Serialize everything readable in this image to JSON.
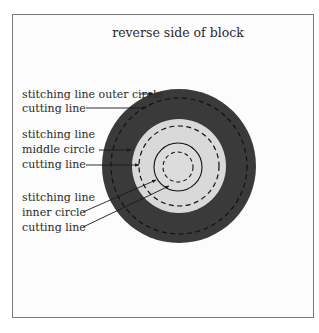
{
  "title": "reverse side of block",
  "labels": {
    "outer_stitch": "stitching line outer circle",
    "outer_cut": "cutting line",
    "middle_stitch_1": "stitching line",
    "middle_stitch_2": "middle circle",
    "middle_cut": "cutting line",
    "inner_stitch_1": "stitching line",
    "inner_stitch_2": "inner circle",
    "inner_cut": "cutting line"
  },
  "colors": {
    "outer_ring": "#3a3a3a",
    "middle_disk": "#d9d9d9",
    "inner_disk": "#dcdcdc",
    "lines": "#1a1a1a",
    "frame": "#7a7a7a"
  }
}
